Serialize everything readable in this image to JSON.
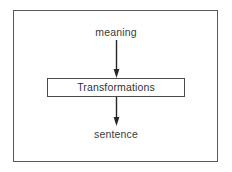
{
  "diagram": {
    "type": "flowchart",
    "orientation": "vertical",
    "frame": {
      "visible": true,
      "border_color": "#5a5a5a"
    },
    "nodes": [
      {
        "id": "meaning",
        "label": "meaning",
        "shape": "text",
        "order": 1
      },
      {
        "id": "transformations",
        "label": "Transformations",
        "shape": "rectangle",
        "order": 2
      },
      {
        "id": "sentence",
        "label": "sentence",
        "shape": "text",
        "order": 3
      }
    ],
    "edges": [
      {
        "id": "meaning-to-transformations",
        "from": "meaning",
        "to": "transformations",
        "style": "solid",
        "arrowhead": "filled-triangle",
        "color": "#262626"
      },
      {
        "id": "transformations-to-sentence",
        "from": "transformations",
        "to": "sentence",
        "style": "solid",
        "arrowhead": "filled-triangle",
        "color": "#262626"
      }
    ]
  }
}
